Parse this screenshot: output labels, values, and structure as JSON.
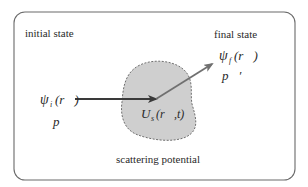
{
  "diagram": {
    "initial": {
      "label": "initial state",
      "wavefunction_symbol": "ψ",
      "wavefunction_sub": "i",
      "wavefunction_arg": "(r⃗)",
      "momentum": "p⃗"
    },
    "final": {
      "label": "final state",
      "wavefunction_symbol": "ψ",
      "wavefunction_sub": "f",
      "wavefunction_arg": "(r⃗)",
      "momentum": "p⃗′"
    },
    "potential": {
      "label": "scattering potential",
      "symbol": "U",
      "sub": "s",
      "arg": "(r⃗,t)"
    },
    "colors": {
      "border": "#6a6a6a",
      "blob_fill": "#cfcfcf",
      "blob_stroke": "#6f6f6f",
      "arrow_incoming": "#3a3a3a",
      "arrow_outgoing": "#707070",
      "text": "#2a2a2a"
    }
  }
}
